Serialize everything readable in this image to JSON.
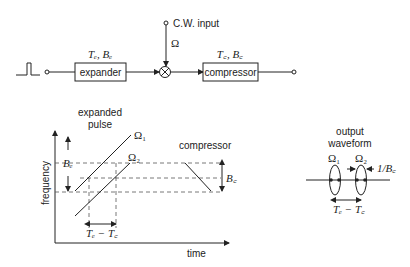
{
  "block_diagram": {
    "expander": {
      "label": "expander",
      "params": "Tₑ, Bₑ"
    },
    "cw_input": {
      "label": "C.W. input"
    },
    "mixer_input_label": "Ω",
    "compressor": {
      "label": "compressor",
      "params": "T꜀, B꜀"
    }
  },
  "graph": {
    "ylabel": "frequency",
    "xlabel": "time",
    "expanded_pulse_label_line1": "expanded",
    "expanded_pulse_label_line2": "pulse",
    "omega1": "Ω₁",
    "omega2": "Ω₂",
    "be_label": "Bₑ",
    "compressor_label": "compressor",
    "bc_label": "B꜀",
    "te_tc_label": "Tₑ − T꜀"
  },
  "output": {
    "title_line1": "output",
    "title_line2": "waveform",
    "omega1": "Ω₁",
    "omega2": "Ω₂",
    "width_label": "1/B꜀",
    "spacing_label": "Tₑ − T꜀"
  }
}
